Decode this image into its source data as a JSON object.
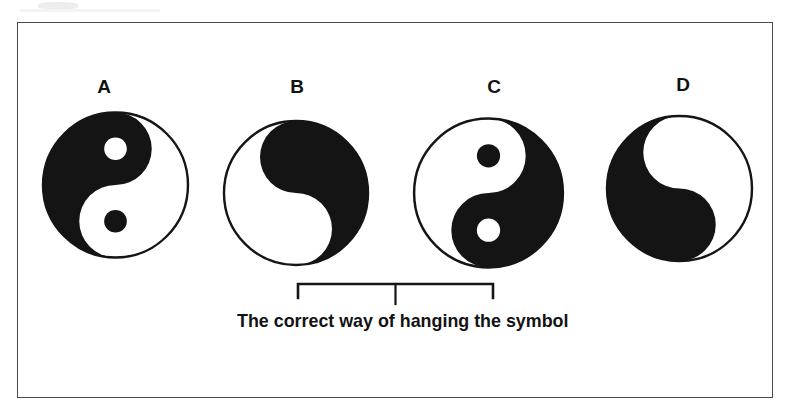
{
  "figure": {
    "type": "multiple-choice-diagram",
    "frame_border_color": "#4a4a4a",
    "ink_color": "#111111",
    "paper_color": "#ffffff"
  },
  "options": [
    {
      "id": "A",
      "label": "A",
      "label_x": 89,
      "label_y": 77,
      "symbol_x": 40,
      "symbol_y": 101,
      "symbol_w": 151,
      "symbol_h": 168,
      "dark_side": "left",
      "rotation_deg": 0,
      "mirrored": false,
      "upper_dot_fill": "white",
      "lower_dot_fill": "black",
      "is_correct": false
    },
    {
      "id": "B",
      "label": "B",
      "label_x": 282,
      "label_y": 77,
      "symbol_x": 221,
      "symbol_y": 107,
      "symbol_w": 150,
      "symbol_h": 172,
      "dark_side": "right",
      "rotation_deg": 0,
      "mirrored": true,
      "upper_dot_fill": "black",
      "lower_dot_fill": "white",
      "is_correct": true
    },
    {
      "id": "C",
      "label": "C",
      "label_x": 479,
      "label_y": 77,
      "symbol_x": 411,
      "symbol_y": 107,
      "symbol_w": 155,
      "symbol_h": 172,
      "dark_side": "right",
      "rotation_deg": 180,
      "mirrored": false,
      "upper_dot_fill": "white",
      "lower_dot_fill": "black",
      "is_correct": true
    },
    {
      "id": "D",
      "label": "D",
      "label_x": 668,
      "label_y": 75,
      "symbol_x": 604,
      "symbol_y": 104,
      "symbol_w": 151,
      "symbol_h": 169,
      "dark_side": "left",
      "rotation_deg": 180,
      "mirrored": true,
      "upper_dot_fill": "black",
      "lower_dot_fill": "white",
      "is_correct": false
    }
  ],
  "bracket": {
    "left_x": 297,
    "right_x": 493,
    "top_y": 284,
    "arm_height": 13,
    "stem_height": 17,
    "spans_options": [
      "B",
      "C"
    ],
    "stroke_color": "#151515"
  },
  "caption": {
    "text": "The correct way of hanging the symbol",
    "x": 237,
    "y": 311
  }
}
